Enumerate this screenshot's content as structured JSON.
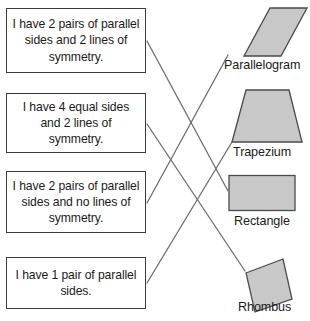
{
  "worksheet": {
    "title_fragment": "",
    "clues": [
      {
        "id": "clue-parallel-2-sym-2",
        "text": "I have 2 pairs of parallel sides and 2 lines of symmetry."
      },
      {
        "id": "clue-4-equal-sym-2",
        "text": "I have 4 equal sides and 2 lines of symmetry."
      },
      {
        "id": "clue-parallel-2-sym-0",
        "text": "I have 2 pairs of parallel sides and no lines of symmetry."
      },
      {
        "id": "clue-parallel-1",
        "text": "I have 1 pair of parallel sides."
      }
    ],
    "shapes": [
      {
        "id": "shape-parallelogram",
        "label": "Parallelogram",
        "kind": "parallelogram"
      },
      {
        "id": "shape-trapezium",
        "label": "Trapezium",
        "kind": "trapezium"
      },
      {
        "id": "shape-rectangle",
        "label": "Rectangle",
        "kind": "rectangle"
      },
      {
        "id": "shape-rhombus",
        "label": "Rhombus",
        "kind": "rhombus"
      }
    ],
    "matches": [
      {
        "from_clue": 0,
        "to_shape": 2
      },
      {
        "from_clue": 1,
        "to_shape": 3
      },
      {
        "from_clue": 2,
        "to_shape": 0
      },
      {
        "from_clue": 3,
        "to_shape": 1
      }
    ],
    "colors": {
      "shape_fill": "#c8c8c8",
      "shape_stroke": "#4a4a4a",
      "box_border": "#3a3a3a",
      "connector": "#6e6e6e",
      "text": "#1a1a1a",
      "background": "#ffffff"
    }
  }
}
